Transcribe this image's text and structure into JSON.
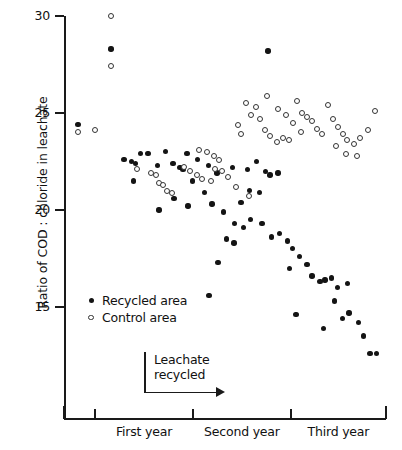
{
  "chart_data": {
    "type": "scatter",
    "title": "",
    "xlabel": "",
    "ylabel": "Ratio of COD : chloride in leachate",
    "ylim": [
      12.4,
      30.2
    ],
    "yticks": [
      15,
      20,
      25,
      30
    ],
    "ytick_labels": [
      "15",
      "20",
      "25",
      "30"
    ],
    "xlim": [
      0,
      100
    ],
    "grid": false,
    "legend_position": "inside-left-lower",
    "x_category_labels": [
      "First year",
      "Second year",
      "Third year"
    ],
    "x_tick_positions": [
      0,
      9.6,
      40.1,
      70.5,
      100
    ],
    "annotation": {
      "text_line1": "Leachate",
      "text_line2": "recycled",
      "arrow": "right"
    },
    "series": [
      {
        "name": "Recycled area",
        "marker": "filled-circle",
        "color": "#141414",
        "points": [
          [
            4.3,
            24.4
          ],
          [
            14.6,
            28.3
          ],
          [
            23.7,
            22.9
          ],
          [
            26.1,
            22.9
          ],
          [
            18.6,
            22.6
          ],
          [
            21.0,
            22.5
          ],
          [
            22.2,
            22.4
          ],
          [
            21.6,
            21.5
          ],
          [
            31.5,
            23.0
          ],
          [
            38.2,
            22.9
          ],
          [
            33.8,
            22.4
          ],
          [
            29.1,
            22.3
          ],
          [
            36.0,
            22.2
          ],
          [
            36.9,
            22.1
          ],
          [
            41.5,
            22.6
          ],
          [
            44.8,
            22.3
          ],
          [
            40.0,
            21.5
          ],
          [
            47.5,
            21.9
          ],
          [
            52.3,
            22.2
          ],
          [
            43.6,
            20.9
          ],
          [
            34.2,
            20.6
          ],
          [
            29.5,
            20.0
          ],
          [
            38.5,
            20.2
          ],
          [
            46.0,
            20.3
          ],
          [
            49.5,
            19.9
          ],
          [
            55.0,
            20.4
          ],
          [
            57.0,
            22.1
          ],
          [
            63.3,
            28.2
          ],
          [
            59.8,
            22.5
          ],
          [
            62.5,
            22.0
          ],
          [
            64.0,
            21.8
          ],
          [
            66.5,
            21.9
          ],
          [
            57.6,
            21.0
          ],
          [
            60.8,
            20.9
          ],
          [
            53.0,
            19.3
          ],
          [
            55.8,
            19.1
          ],
          [
            50.4,
            18.5
          ],
          [
            52.8,
            18.3
          ],
          [
            47.8,
            17.3
          ],
          [
            45.0,
            15.6
          ],
          [
            58.0,
            19.5
          ],
          [
            61.5,
            19.3
          ],
          [
            64.5,
            18.6
          ],
          [
            67.0,
            18.8
          ],
          [
            69.5,
            18.4
          ],
          [
            71.0,
            18.0
          ],
          [
            73.2,
            17.6
          ],
          [
            70.0,
            17.0
          ],
          [
            75.5,
            17.2
          ],
          [
            77.0,
            16.6
          ],
          [
            79.5,
            16.3
          ],
          [
            81.0,
            16.4
          ],
          [
            83.0,
            16.5
          ],
          [
            85.0,
            16.0
          ],
          [
            84.0,
            15.3
          ],
          [
            88.0,
            16.2
          ],
          [
            72.0,
            14.6
          ],
          [
            80.5,
            13.9
          ],
          [
            86.5,
            14.4
          ],
          [
            88.5,
            14.7
          ],
          [
            91.5,
            14.2
          ],
          [
            93.0,
            13.5
          ],
          [
            95.0,
            12.6
          ],
          [
            97.0,
            12.6
          ]
        ]
      },
      {
        "name": "Control area",
        "marker": "open-circle",
        "color": "#ffffff",
        "points": [
          [
            4.3,
            24.0
          ],
          [
            9.5,
            24.1
          ],
          [
            14.6,
            30.0
          ],
          [
            14.6,
            27.4
          ],
          [
            22.6,
            22.1
          ],
          [
            27.0,
            21.9
          ],
          [
            28.6,
            21.8
          ],
          [
            29.5,
            21.4
          ],
          [
            30.7,
            21.3
          ],
          [
            32.0,
            21.0
          ],
          [
            33.4,
            20.9
          ],
          [
            37.2,
            22.2
          ],
          [
            39.0,
            22.0
          ],
          [
            41.2,
            21.8
          ],
          [
            43.0,
            21.6
          ],
          [
            45.5,
            21.5
          ],
          [
            47.0,
            22.1
          ],
          [
            49.0,
            22.0
          ],
          [
            51.0,
            21.7
          ],
          [
            53.5,
            21.2
          ],
          [
            42.0,
            23.1
          ],
          [
            44.5,
            23.0
          ],
          [
            46.5,
            22.8
          ],
          [
            48.0,
            22.6
          ],
          [
            56.5,
            25.5
          ],
          [
            58.0,
            24.9
          ],
          [
            59.5,
            25.3
          ],
          [
            61.0,
            24.7
          ],
          [
            54.0,
            24.4
          ],
          [
            55.0,
            23.9
          ],
          [
            62.5,
            24.1
          ],
          [
            57.5,
            20.7
          ],
          [
            64.0,
            23.8
          ],
          [
            66.0,
            23.5
          ],
          [
            68.0,
            23.7
          ],
          [
            70.0,
            23.6
          ],
          [
            72.5,
            25.6
          ],
          [
            74.0,
            25.0
          ],
          [
            75.5,
            24.8
          ],
          [
            77.0,
            24.6
          ],
          [
            78.5,
            24.2
          ],
          [
            80.0,
            23.9
          ],
          [
            71.0,
            24.5
          ],
          [
            73.5,
            24.0
          ],
          [
            82.0,
            25.4
          ],
          [
            83.5,
            24.7
          ],
          [
            85.0,
            24.3
          ],
          [
            86.5,
            23.9
          ],
          [
            88.0,
            23.6
          ],
          [
            90.0,
            23.4
          ],
          [
            92.0,
            23.7
          ],
          [
            94.5,
            24.1
          ],
          [
            96.5,
            25.1
          ],
          [
            84.5,
            23.3
          ],
          [
            87.5,
            22.9
          ],
          [
            91.0,
            22.8
          ],
          [
            63.0,
            25.9
          ],
          [
            66.5,
            25.2
          ],
          [
            69.0,
            24.9
          ]
        ]
      }
    ]
  },
  "legend": {
    "items": [
      {
        "label": "Recycled area",
        "marker": "filled-circle"
      },
      {
        "label": "Control area",
        "marker": "open-circle"
      }
    ]
  }
}
